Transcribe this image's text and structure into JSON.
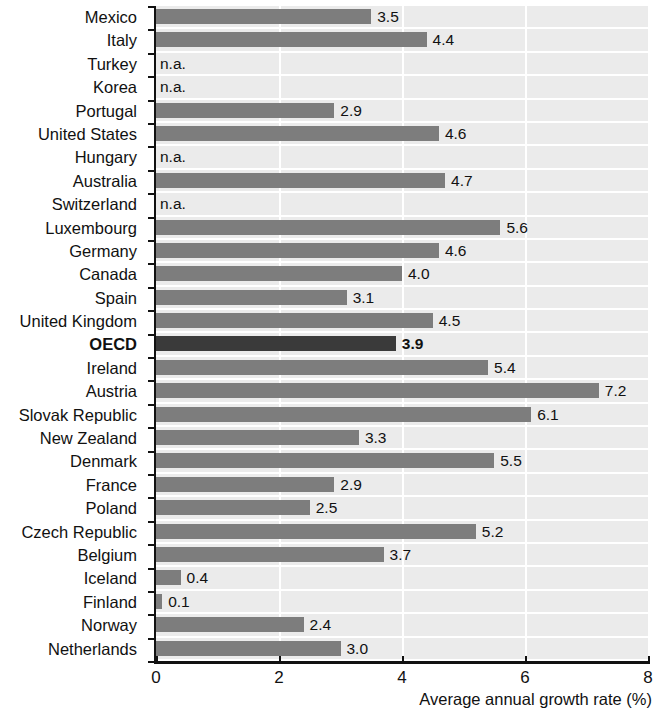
{
  "chart_data": {
    "type": "bar",
    "orientation": "horizontal",
    "title": "",
    "xlabel": "Average annual growth rate (%)",
    "ylabel": "",
    "xlim": [
      0,
      8
    ],
    "xticks": [
      "0",
      "2",
      "4",
      "6",
      "8"
    ],
    "grid": "vertical",
    "legend": "none",
    "na_text": "n.a.",
    "highlight_category": "OECD",
    "categories": [
      "Mexico",
      "Italy",
      "Turkey",
      "Korea",
      "Portugal",
      "United States",
      "Hungary",
      "Australia",
      "Switzerland",
      "Luxembourg",
      "Germany",
      "Canada",
      "Spain",
      "United Kingdom",
      "OECD",
      "Ireland",
      "Austria",
      "Slovak Republic",
      "New Zealand",
      "Denmark",
      "France",
      "Poland",
      "Czech Republic",
      "Belgium",
      "Iceland",
      "Finland",
      "Norway",
      "Netherlands"
    ],
    "values": [
      3.5,
      4.4,
      null,
      null,
      2.9,
      4.6,
      null,
      4.7,
      null,
      5.6,
      4.6,
      4.0,
      3.1,
      4.5,
      3.9,
      5.4,
      7.2,
      6.1,
      3.3,
      5.5,
      2.9,
      2.5,
      5.2,
      3.7,
      0.4,
      0.1,
      2.4,
      3.0
    ],
    "labels": [
      "3.5",
      "4.4",
      "n.a.",
      "n.a.",
      "2.9",
      "4.6",
      "n.a.",
      "4.7",
      "n.a.",
      "5.6",
      "4.6",
      "4.0",
      "3.1",
      "4.5",
      "3.9",
      "5.4",
      "7.2",
      "6.1",
      "3.3",
      "5.5",
      "2.9",
      "2.5",
      "5.2",
      "3.7",
      "0.4",
      "0.1",
      "2.4",
      "3.0"
    ],
    "colors": {
      "bar": "#7d7d7d",
      "bar_highlight": "#3a3a3a",
      "plot_background": "#ebebeb",
      "gridline": "#ffffff",
      "axis": "#111111",
      "text": "#111111"
    }
  }
}
